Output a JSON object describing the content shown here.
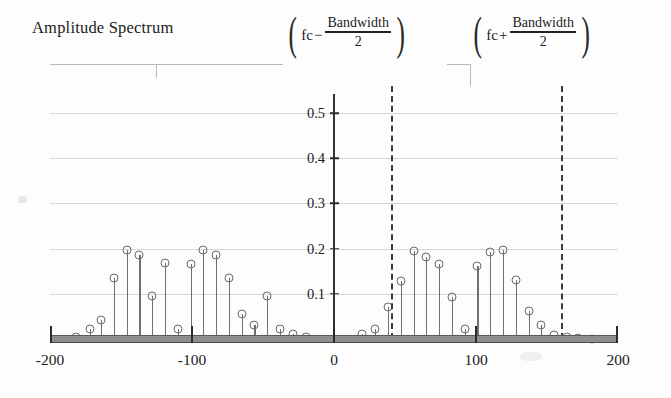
{
  "title": "Amplitude Spectrum",
  "annotations": {
    "lower": {
      "fc": "fc",
      "operator": "−",
      "numerator": "Bandwidth",
      "denominator": "2",
      "x_value": 40
    },
    "upper": {
      "fc": "fc",
      "operator": "+",
      "numerator": "Bandwidth",
      "denominator": "2",
      "x_value": 160
    }
  },
  "axes": {
    "x_ticks": [
      "-200",
      "-100",
      "0",
      "100",
      "200"
    ],
    "x_tick_values": [
      -200,
      -100,
      0,
      100,
      200
    ],
    "y_ticks": [
      "0.1",
      "0.2",
      "0.3",
      "0.4",
      "0.5"
    ],
    "y_tick_values": [
      0.1,
      0.2,
      0.3,
      0.4,
      0.5
    ]
  },
  "chart_data": {
    "type": "scatter",
    "title": "Amplitude Spectrum",
    "xlabel": "",
    "ylabel": "",
    "xlim": [
      -200,
      200
    ],
    "ylim": [
      0,
      0.56
    ],
    "grid": true,
    "legend": null,
    "marker": "open-circle",
    "stems": true,
    "series": [
      {
        "name": "Amplitude Spectrum",
        "x": [
          -182,
          -172,
          -164,
          -155,
          -146,
          -137,
          -128,
          -119,
          -110,
          -101,
          -92,
          -83,
          -74,
          -65,
          -56,
          -47,
          -38,
          -29,
          -20,
          20,
          29,
          38,
          47,
          56,
          65,
          74,
          83,
          92,
          101,
          110,
          119,
          128,
          137,
          146,
          155,
          164,
          172,
          182
        ],
        "y": [
          0.005,
          0.022,
          0.042,
          0.135,
          0.198,
          0.185,
          0.095,
          0.168,
          0.022,
          0.165,
          0.198,
          0.185,
          0.135,
          0.055,
          0.03,
          0.095,
          0.022,
          0.01,
          0.004,
          0.01,
          0.022,
          0.07,
          0.128,
          0.195,
          0.182,
          0.165,
          0.092,
          0.022,
          0.162,
          0.192,
          0.198,
          0.13,
          0.062,
          0.03,
          0.008,
          0.004,
          0.002,
          0.001
        ]
      }
    ],
    "cutoff_lines": [
      {
        "label": "fc - Bandwidth/2",
        "x": 40,
        "style": "dashed"
      },
      {
        "label": "fc + Bandwidth/2",
        "x": 160,
        "style": "dashed"
      }
    ]
  },
  "colors": {
    "stem": "#6f6f6f",
    "axis": "#2b2b2b",
    "grid": "#d9d6d2",
    "baseline": "#8d8d8d",
    "cutoff": "#3a3a3a"
  }
}
